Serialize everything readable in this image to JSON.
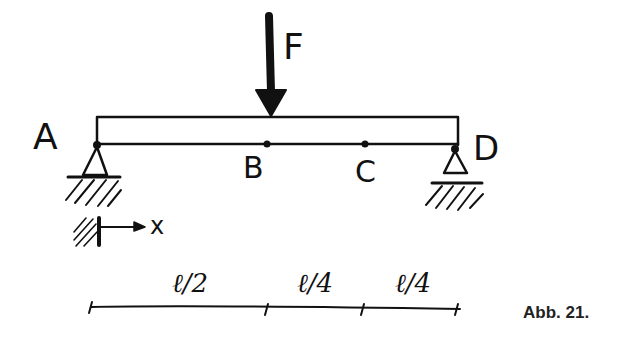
{
  "figure": {
    "caption": "Abb. 21.",
    "force_label": "F",
    "points": {
      "A": "A",
      "B": "B",
      "C": "C",
      "D": "D"
    },
    "axis_label": "x",
    "dimensions": [
      {
        "label": "ℓ/2",
        "span": "A–B"
      },
      {
        "label": "ℓ/4",
        "span": "B–C"
      },
      {
        "label": "ℓ/4",
        "span": "C–D"
      }
    ],
    "colors": {
      "ink": "#111111",
      "background": "#ffffff"
    }
  }
}
